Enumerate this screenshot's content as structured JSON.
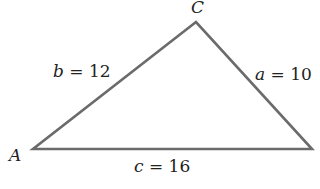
{
  "diagram": {
    "type": "triangle",
    "vertices": {
      "A": {
        "label": "A",
        "x": 33,
        "y": 149
      },
      "B": {
        "label": "",
        "x": 312,
        "y": 149
      },
      "C": {
        "label": "C",
        "x": 196,
        "y": 22
      }
    },
    "sides": {
      "a": {
        "var": "a",
        "eq": " = ",
        "value": "10",
        "from": "B",
        "to": "C"
      },
      "b": {
        "var": "b",
        "eq": " = ",
        "value": "12",
        "from": "A",
        "to": "C"
      },
      "c": {
        "var": "c",
        "eq": " = ",
        "value": "16",
        "from": "A",
        "to": "B"
      }
    },
    "colors": {
      "edge": "#6b6b6b",
      "text": "#222222",
      "background": "#ffffff"
    }
  }
}
